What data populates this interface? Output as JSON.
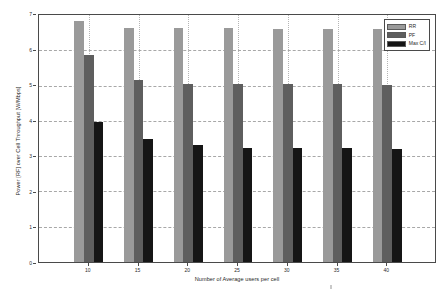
{
  "chart_data": {
    "type": "bar",
    "title": "",
    "xlabel": "Number of Average users per cell",
    "ylabel": "Power [RF] over Cell Throughput [W/Mbps]",
    "categories": [
      "10",
      "15",
      "20",
      "25",
      "30",
      "35",
      "40"
    ],
    "series": [
      {
        "name": "RR",
        "color": "#9a9a9a",
        "values": [
          6.78,
          6.58,
          6.57,
          6.57,
          6.56,
          6.55,
          6.55
        ]
      },
      {
        "name": "PF",
        "color": "#5e5e5e",
        "values": [
          5.82,
          5.12,
          5.0,
          5.0,
          5.0,
          5.0,
          4.99
        ]
      },
      {
        "name": "Max C/I",
        "color": "#151515",
        "values": [
          3.94,
          3.46,
          3.28,
          3.2,
          3.2,
          3.2,
          3.19
        ]
      }
    ],
    "ylim": [
      0,
      7
    ],
    "yticks": [
      "0",
      "1",
      "2",
      "3",
      "4",
      "5",
      "6",
      "7"
    ],
    "ytick_values": [
      0,
      1,
      2,
      3,
      4,
      5,
      6,
      7
    ],
    "grid": true,
    "legend_position": "top-right"
  },
  "legend": {
    "entries": [
      {
        "label": "RR"
      },
      {
        "label": "PF"
      },
      {
        "label": "Max C/I"
      }
    ]
  },
  "axes": {
    "frame_color": "#4a4a4a",
    "grid_color": "#a8a8a8",
    "background": "#ffffff"
  }
}
